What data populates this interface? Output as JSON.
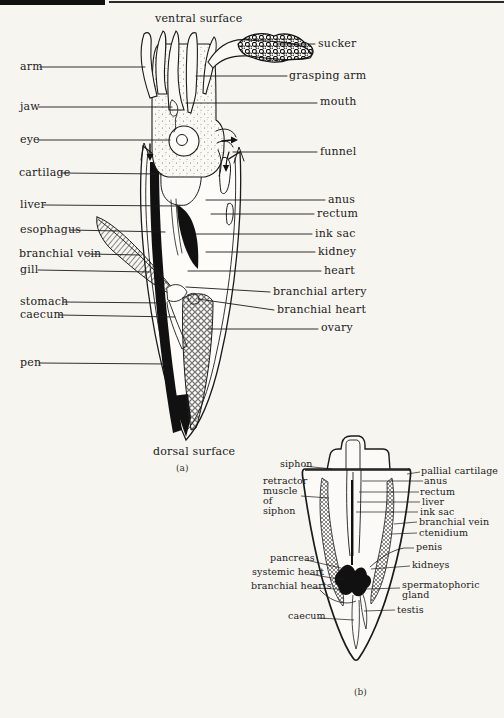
{
  "colors": {
    "paper": "#f7f5f0",
    "ink": "#1b1b1b"
  },
  "panel_a": {
    "caption": "(a)",
    "top_label": "ventral surface",
    "bottom_label": "dorsal surface",
    "left_labels": [
      "arm",
      "jaw",
      "eye",
      "cartilage",
      "liver",
      "esophagus",
      "branchial vein",
      "gill",
      "stomach",
      "caecum",
      "pen"
    ],
    "right_labels": [
      "sucker",
      "grasping arm",
      "mouth",
      "funnel",
      "anus",
      "rectum",
      "ink sac",
      "kidney",
      "heart",
      "branchial artery",
      "branchial heart",
      "ovary"
    ]
  },
  "panel_b": {
    "caption": "(b)",
    "left_labels": [
      "siphon",
      "retractor muscle of siphon",
      "pancreas",
      "systemic heart",
      "branchial hearts",
      "caecum"
    ],
    "right_labels": [
      "pallial cartilage",
      "anus",
      "rectum",
      "liver",
      "ink sac",
      "branchial vein",
      "ctenidium",
      "penis",
      "kidneys",
      "spermatophoric gland",
      "testis"
    ]
  }
}
